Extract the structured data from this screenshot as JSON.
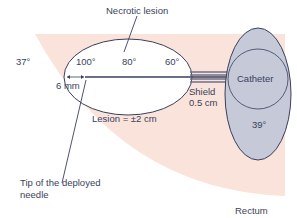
{
  "diagram": {
    "labels": {
      "necrotic_lesion": "Necrotic lesion",
      "temp_tissue": "37°",
      "temp_100": "100°",
      "temp_80": "80°",
      "temp_60": "60°",
      "distance": "6 mm",
      "shield_line1": "Shield",
      "shield_line2": "0.5 cm",
      "lesion_size": "Lesion = ±2 cm",
      "catheter": "Catheter",
      "temp_catheter": "39°",
      "needle_tip_line1": "Tip of the deployed",
      "needle_tip_line2": "needle",
      "rectum": "Rectum"
    },
    "colors": {
      "tissue": "#f9e3da",
      "lesion": "#ffffff",
      "catheter": "#c5c9d8",
      "outline": "#3a3f5c",
      "text": "#3a3f5c"
    }
  }
}
